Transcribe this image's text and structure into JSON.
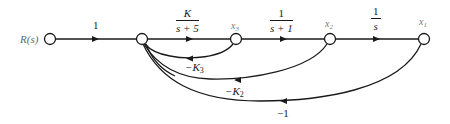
{
  "diagram": {
    "type": "signal-flow-graph",
    "stroke_color": "#1a1a1a",
    "nodes": [
      {
        "id": "R",
        "label": "R(s)",
        "x": 50,
        "y": 39
      },
      {
        "id": "n1",
        "label": "",
        "x": 142,
        "y": 39
      },
      {
        "id": "x3",
        "label": "x",
        "sub": "3",
        "x": 236,
        "y": 39
      },
      {
        "id": "x2",
        "label": "x",
        "sub": "2",
        "x": 330,
        "y": 39
      },
      {
        "id": "x1",
        "label": "x",
        "sub": "1",
        "x": 424,
        "y": 39
      }
    ],
    "forward_branches": [
      {
        "from": "R",
        "to": "n1",
        "gain": "1"
      },
      {
        "from": "n1",
        "to": "x3",
        "gain_num": "K",
        "gain_den": "s + 5"
      },
      {
        "from": "x3",
        "to": "x2",
        "gain_num": "1",
        "gain_den": "s + 1"
      },
      {
        "from": "x2",
        "to": "x1",
        "gain_num": "1",
        "gain_den": "s"
      }
    ],
    "feedback_branches": [
      {
        "from": "x3",
        "to": "n1",
        "gain": "−K",
        "sub": "3"
      },
      {
        "from": "x2",
        "to": "n1",
        "gain": "−K",
        "sub": "2"
      },
      {
        "from": "x1",
        "to": "n1",
        "gain": "−1",
        "sub": ""
      }
    ]
  }
}
